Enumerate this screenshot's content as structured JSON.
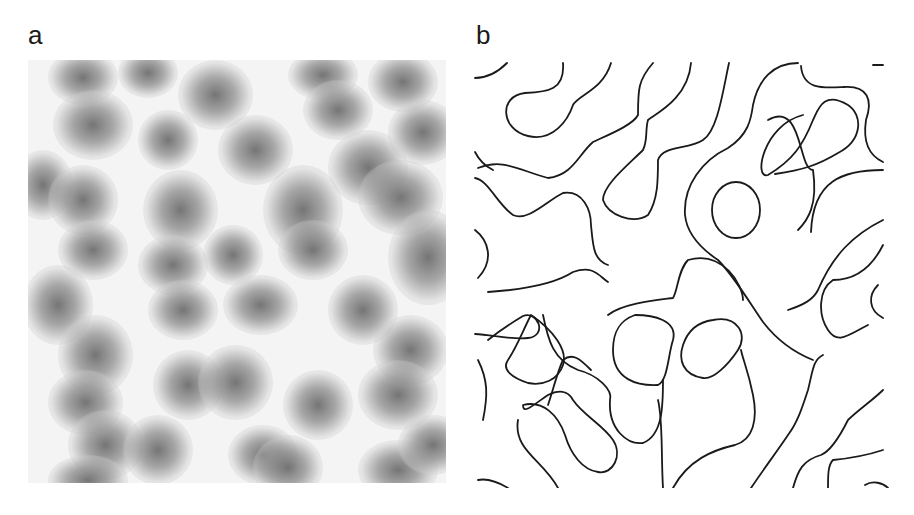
{
  "figure": {
    "panels": [
      {
        "label": "a",
        "description": "grayscale speckle intensity field"
      },
      {
        "label": "b",
        "description": "contour lines of the field"
      }
    ]
  },
  "colors": {
    "background": "#ffffff",
    "contour_stroke": "#1a1a1a",
    "speckle_dark": "#6e6e6e",
    "speckle_light": "#f4f4f4"
  }
}
